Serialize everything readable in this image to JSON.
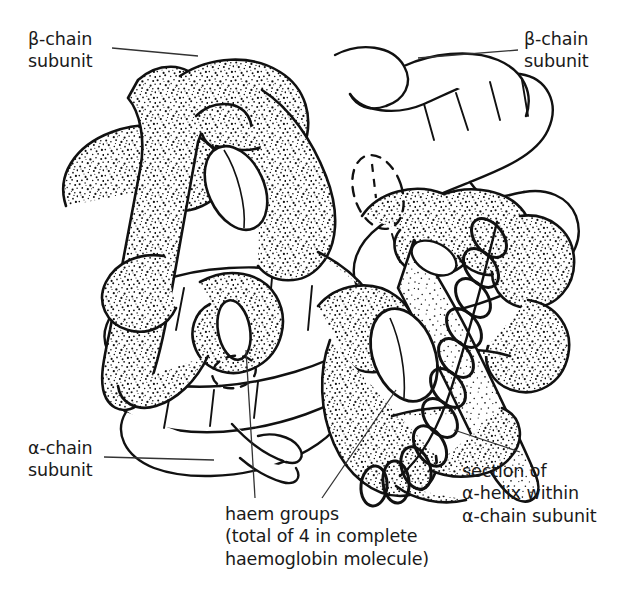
{
  "figure": {
    "subject": "haemoglobin",
    "background_color": "#ffffff",
    "ink_color": "#111111",
    "style": "line drawing with stippled shading"
  },
  "labels": {
    "beta_left": {
      "line1": "β-chain",
      "line2": "subunit",
      "full": "β-chain subunit"
    },
    "beta_right": {
      "line1": "β-chain",
      "line2": "subunit",
      "full": "β-chain subunit"
    },
    "alpha_left": {
      "line1": "α-chain",
      "line2": "subunit",
      "full": "α-chain subunit"
    },
    "alpha_helix": {
      "line1": "section of",
      "line2": "α-helix within",
      "line3": "α-chain subunit",
      "full": "section of α-helix within α-chain subunit"
    },
    "haem": {
      "line1": "haem groups",
      "line2": "(total of 4 in complete",
      "line3": "haemoglobin molecule)",
      "full": "haem groups (total of 4 in complete haemoglobin molecule)"
    }
  },
  "structures": {
    "subunit_count": 4,
    "haem_group_count": 4,
    "alpha_chain_count": 2,
    "beta_chain_count": 2,
    "beta_fill": "stippled",
    "alpha_fill": "plain-white",
    "haem_shape": "ellipse-disc",
    "helix_shape": "coiled-spring"
  }
}
